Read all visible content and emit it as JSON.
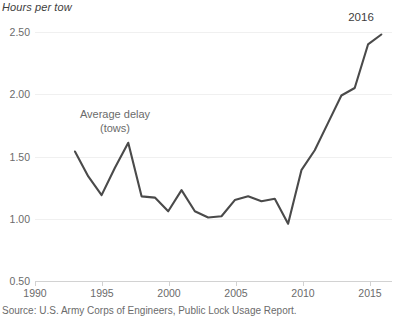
{
  "chart_data": {
    "type": "line",
    "title": "",
    "subtitle": "",
    "unit_label": "Hours per tow",
    "xlabel": "",
    "ylabel": "Hours per tow",
    "xlim": [
      1990,
      2016.8
    ],
    "ylim": [
      0.5,
      2.5
    ],
    "grid": true,
    "legend_position": "inline-annotation",
    "x_tick_labels": [
      "1990",
      "1995",
      "2000",
      "2005",
      "2010",
      "2015"
    ],
    "x_ticks": [
      1990,
      1995,
      2000,
      2005,
      2010,
      2015
    ],
    "y_tick_labels": [
      "0.50",
      "1.00",
      "1.50",
      "2.00",
      "2.50"
    ],
    "y_ticks": [
      0.5,
      1.0,
      1.5,
      2.0,
      2.5
    ],
    "series": [
      {
        "name": "Average delay (tows)",
        "color": "#4a4a4a",
        "x": [
          1993,
          1994,
          1995,
          1996,
          1997,
          1998,
          1999,
          2000,
          2001,
          2002,
          2003,
          2004,
          2005,
          2006,
          2007,
          2008,
          2009,
          2010,
          2011,
          2012,
          2013,
          2014,
          2015,
          2016
        ],
        "values": [
          1.54,
          1.34,
          1.19,
          1.41,
          1.61,
          1.18,
          1.17,
          1.06,
          1.23,
          1.06,
          1.01,
          1.02,
          1.15,
          1.18,
          1.14,
          1.16,
          0.96,
          1.39,
          1.55,
          1.77,
          1.99,
          2.05,
          2.4,
          2.48
        ]
      }
    ],
    "annotations": [
      {
        "id": "series-label",
        "text_line1": "Average delay",
        "text_line2": "(tows)",
        "x": 1996,
        "y": 1.85
      },
      {
        "id": "endpoint-year",
        "text": "2016",
        "x": 2016,
        "y": 2.5
      }
    ],
    "source": "Source: U.S. Army Corps of Engineers, Public Lock Usage Report."
  },
  "colors": {
    "line": "#4a4a4a",
    "gridline": "#f0f0f0",
    "axis": "#d2d2d2",
    "text": "#6b6b6b",
    "text_dark": "#3d3d3d",
    "background": "#ffffff"
  }
}
